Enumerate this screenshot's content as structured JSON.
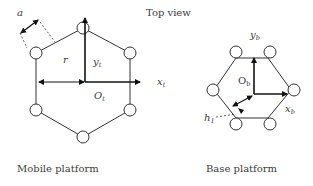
{
  "title": "Top view",
  "mobile_platform": {
    "caption": "Mobile platform",
    "labels": {
      "a": "a",
      "r": "r",
      "yt": "y",
      "yt_sub": "t",
      "xt": "x",
      "xt_sub": "t",
      "ot": "O",
      "ot_sub": "t"
    }
  },
  "base_platform": {
    "caption": "Base platform",
    "labels": {
      "yb": "y",
      "yb_sub": "b",
      "xb": "x",
      "xb_sub": "b",
      "ob": "O",
      "ob_sub": "b",
      "h": "h",
      "h_sub": "1"
    }
  },
  "colors": {
    "line": "#333333",
    "text": "#3a3a3a",
    "background": "#ffffff"
  }
}
